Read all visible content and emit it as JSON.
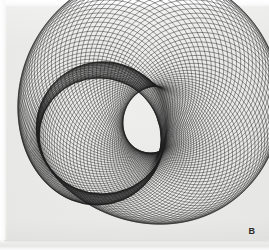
{
  "figure": {
    "caption_label": "B",
    "title": "",
    "background_color": "#f1f1f0",
    "ink_color": "#1d1d1d",
    "width_px": 269,
    "height_px": 250
  },
  "chart_data": {
    "type": "line",
    "title": "",
    "subtitle": "",
    "xlabel": "",
    "ylabel": "",
    "xlim": [
      0,
      269
    ],
    "ylim": [
      0,
      250
    ],
    "grid": false,
    "legend": null,
    "annotations": [
      {
        "text": "B",
        "x": 248,
        "y": 229,
        "role": "panel-label"
      }
    ],
    "rendering": {
      "circle_count": 120,
      "stroke_width": 0.55,
      "stroke_color": "#1d1d1d",
      "stroke_opacity": 0.82,
      "fill": "none"
    },
    "generator": {
      "parameter_name": "t",
      "parameter_range_deg": [
        0,
        360
      ],
      "centre_path": {
        "form": "ellipse-with-second-harmonic",
        "cx": 133,
        "cy": 119,
        "a": 52,
        "b": 31,
        "harmonic2_amp_x": 17,
        "harmonic2_amp_y": 24,
        "harmonic2_phase_deg": 18,
        "rotation_deg": -19
      },
      "radius_path": {
        "form": "constant-plus-harmonic",
        "r0": 74,
        "r1_amp": 12,
        "r1_phase_deg": 40,
        "r2_amp": 5,
        "r2_phase_deg": 115
      }
    },
    "series": [
      {
        "name": "circle-family",
        "kind": "envelope-of-circles",
        "values": []
      }
    ]
  }
}
